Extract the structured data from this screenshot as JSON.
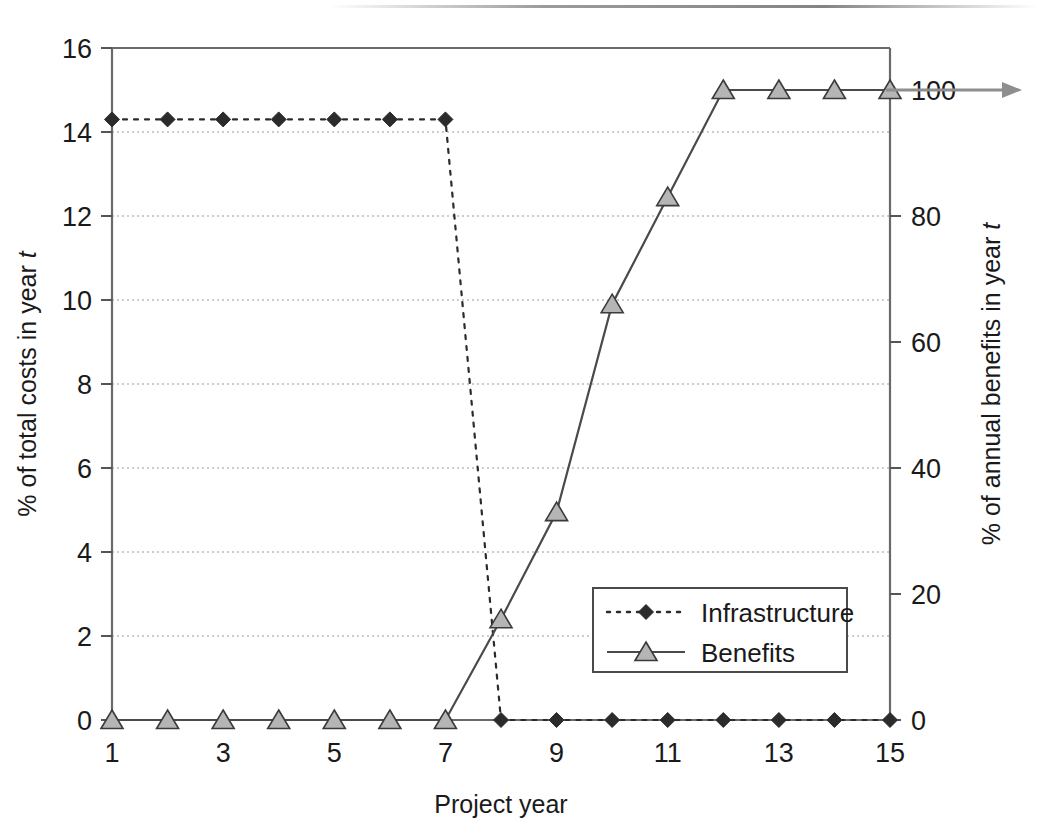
{
  "figure": {
    "caption": "",
    "axes": {
      "x": {
        "label": "Project year",
        "ticks": [
          1,
          2,
          3,
          4,
          5,
          6,
          7,
          8,
          9,
          10,
          11,
          12,
          13,
          14,
          15
        ],
        "tick_labels": [
          "1",
          "",
          "3",
          "",
          "5",
          "",
          "7",
          "",
          "9",
          "",
          "11",
          "",
          "13",
          "",
          "15"
        ],
        "min": 1,
        "max": 15
      },
      "y_left": {
        "label": "% of total costs in year t",
        "label_plain": "% of total costs in year",
        "label_italic": "t",
        "ticks": [
          0,
          2,
          4,
          6,
          8,
          10,
          12,
          14,
          16
        ],
        "tick_labels": [
          "0",
          "2",
          "4",
          "6",
          "8",
          "10",
          "12",
          "14",
          "16"
        ],
        "min": 0,
        "max": 16
      },
      "y_right": {
        "label": "% of annual benefits in year t",
        "label_plain": "% of annual benefits in year",
        "label_italic": "t",
        "ticks": [
          0,
          20,
          40,
          60,
          80,
          100
        ],
        "tick_labels": [
          "0",
          "20",
          "40",
          "60",
          "80",
          "100"
        ],
        "min": 0,
        "max": 106.67
      }
    },
    "legend": {
      "position": "inside-lower-right",
      "entries": [
        {
          "label": "Infrastructure",
          "style": "dotted",
          "marker": "diamond",
          "color": "#2b2b2b"
        },
        {
          "label": "Benefits",
          "style": "solid",
          "marker": "triangle",
          "color": "#4a4a4a"
        }
      ]
    },
    "annotation": {
      "arrow": "continues-at-100-percent"
    }
  },
  "chart_data": {
    "type": "line",
    "title": "",
    "xlabel": "Project year",
    "ylabel": "% of total costs in year t",
    "ylabel_secondary": "% of annual benefits in year t",
    "x": [
      1,
      2,
      3,
      4,
      5,
      6,
      7,
      8,
      9,
      10,
      11,
      12,
      13,
      14,
      15
    ],
    "xlim": [
      1,
      15
    ],
    "ylim": [
      0,
      16
    ],
    "ylim_secondary": [
      0,
      106.67
    ],
    "grid": true,
    "legend_position": "inside lower right",
    "series": [
      {
        "name": "Infrastructure",
        "axis": "left",
        "units": "% of total costs",
        "marker": "diamond",
        "linestyle": "dotted",
        "values": [
          14.3,
          14.3,
          14.3,
          14.3,
          14.3,
          14.3,
          14.3,
          0,
          0,
          0,
          0,
          0,
          0,
          0,
          0
        ]
      },
      {
        "name": "Benefits",
        "axis": "right",
        "units": "% of annual benefits",
        "marker": "triangle",
        "linestyle": "solid",
        "values": [
          0,
          0,
          0,
          0,
          0,
          0,
          0,
          16,
          33,
          66,
          83,
          100,
          100,
          100,
          100
        ]
      }
    ]
  }
}
